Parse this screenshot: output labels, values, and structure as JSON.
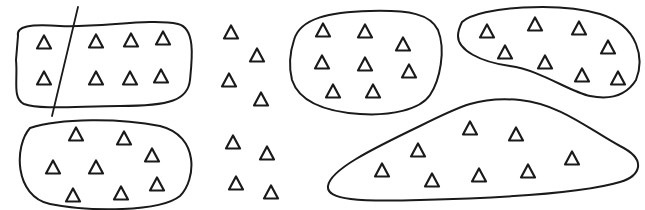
{
  "diagram": {
    "type": "clusters-of-triangles",
    "stroke_color": "#1a1a1a",
    "background": "#ffffff",
    "groups": [
      {
        "id": "top-left-split",
        "shape": "rounded-rectangle-blob",
        "path": "M18,36 C16,26 30,24 60,26 C100,28 150,18 178,24 C196,28 192,60 190,80 C188,100 170,106 120,106 C80,106 40,110 24,104 C12,98 18,80 16,60 Z",
        "divider": {
          "x1": 78,
          "y1": 7,
          "x2": 52,
          "y2": 116
        },
        "triangles": [
          [
            44,
            42
          ],
          [
            44,
            78
          ],
          [
            96,
            41
          ],
          [
            131,
            40
          ],
          [
            163,
            38
          ],
          [
            96,
            78
          ],
          [
            130,
            78
          ],
          [
            161,
            76
          ]
        ]
      },
      {
        "id": "bottom-left",
        "shape": "ellipse-blob",
        "path": "M30,128 C60,118 120,118 160,126 C200,136 196,180 180,196 C160,212 90,212 50,204 C14,196 14,146 30,128 Z",
        "triangles": [
          [
            76,
            134
          ],
          [
            124,
            138
          ],
          [
            152,
            155
          ],
          [
            53,
            167
          ],
          [
            96,
            167
          ],
          [
            157,
            184
          ],
          [
            73,
            195
          ],
          [
            121,
            193
          ]
        ]
      },
      {
        "id": "middle-unclustered",
        "shape": "none",
        "triangles": [
          [
            231,
            32
          ],
          [
            257,
            55
          ],
          [
            229,
            80
          ],
          [
            261,
            99
          ],
          [
            233,
            142
          ],
          [
            267,
            153
          ],
          [
            236,
            183
          ],
          [
            271,
            192
          ]
        ]
      },
      {
        "id": "top-center",
        "shape": "rounded-blob",
        "path": "M294,40 C300,18 330,12 370,11 C410,10 430,14 438,30 C446,50 440,80 430,95 C420,110 390,116 360,114 C330,112 300,104 292,80 C288,64 290,52 294,40 Z",
        "triangles": [
          [
            323,
            30
          ],
          [
            365,
            31
          ],
          [
            403,
            44
          ],
          [
            322,
            62
          ],
          [
            365,
            64
          ],
          [
            409,
            71
          ],
          [
            333,
            91
          ],
          [
            373,
            91
          ]
        ]
      },
      {
        "id": "top-right",
        "shape": "kidney-blob",
        "path": "M462,22 C480,6 560,2 600,14 C640,26 644,60 636,80 C626,96 610,100 590,96 C570,92 540,70 510,66 C480,62 458,50 458,36 C458,30 460,26 462,22 Z",
        "triangles": [
          [
            487,
            31
          ],
          [
            535,
            24
          ],
          [
            579,
            28
          ],
          [
            505,
            52
          ],
          [
            545,
            62
          ],
          [
            608,
            47
          ],
          [
            582,
            75
          ],
          [
            618,
            78
          ]
        ]
      },
      {
        "id": "bottom-right",
        "shape": "mound-blob",
        "path": "M328,186 C330,170 370,150 420,126 C460,106 480,96 520,100 C560,104 590,130 620,146 C648,160 640,176 620,182 C580,194 500,198 420,200 C360,202 326,200 328,186 Z",
        "triangles": [
          [
            470,
            128
          ],
          [
            516,
            134
          ],
          [
            418,
            150
          ],
          [
            382,
            170
          ],
          [
            432,
            180
          ],
          [
            479,
            175
          ],
          [
            528,
            171
          ],
          [
            572,
            158
          ]
        ]
      }
    ]
  }
}
